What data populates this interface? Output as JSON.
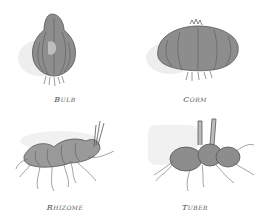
{
  "figure": {
    "panels": [
      {
        "id": "bulb",
        "label": "Bulb"
      },
      {
        "id": "corm",
        "label": "Corm"
      },
      {
        "id": "rhizome",
        "label": "Rhizome"
      },
      {
        "id": "tuber",
        "label": "Tuber"
      }
    ]
  },
  "colors": {
    "ink": "#555555",
    "wash": "#8a8a8a",
    "shadow": "#e6e6e6"
  }
}
